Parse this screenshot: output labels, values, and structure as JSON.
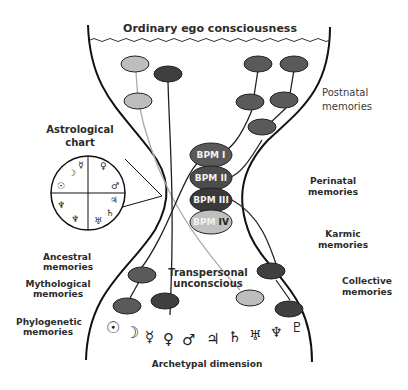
{
  "title": "Ordinary ego consciousness",
  "labels": {
    "astrological_chart": [
      "Astrological",
      "chart"
    ],
    "postnatal": [
      "Postnatal",
      "memories"
    ],
    "perinatal": [
      "Perinatal",
      "memories"
    ],
    "karmic": [
      "Karmic",
      "memories"
    ],
    "collective": [
      "Collective",
      "memories"
    ],
    "ancestral": [
      "Ancestral",
      "memories"
    ],
    "mythological": [
      "Mythological",
      "memories"
    ],
    "phylogenetic": [
      "Phylogenetic",
      "memories"
    ],
    "transpersonal": [
      "Transpersonal",
      "unconscious"
    ],
    "archetypal": "Archetypal dimension"
  },
  "bpm": [
    {
      "prefix": "BPM",
      "numeral": "I"
    },
    {
      "prefix": "BPM",
      "numeral": "II"
    },
    {
      "prefix": "BPM",
      "numeral": "III"
    },
    {
      "prefix": "BPM",
      "numeral": "IV"
    }
  ],
  "planet_glyphs": [
    "☉",
    "☽",
    "☿",
    "♀",
    "♂",
    "♃",
    "♄",
    "♅",
    "♆",
    "♇"
  ],
  "chart_glyphs": {
    "top_left": [
      "☽",
      "☿"
    ],
    "top_right": [
      "♀",
      "♂"
    ],
    "left": "☉",
    "bottom_left": [
      "♆",
      "♆"
    ],
    "bottom_right": [
      "♃",
      "♄",
      "♅"
    ]
  },
  "colors": {
    "dark": "#3f3f3f",
    "mid": "#5a5a5a",
    "light": "#bdbdbd",
    "outline": "#111111"
  }
}
